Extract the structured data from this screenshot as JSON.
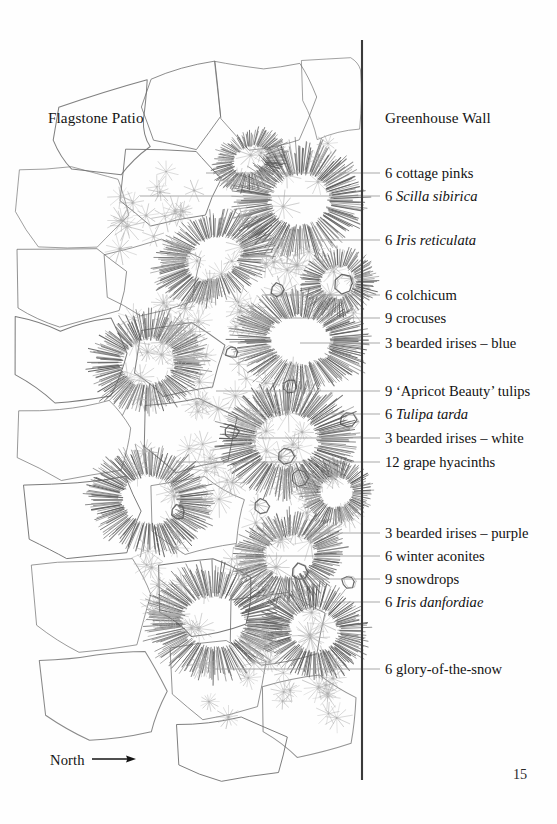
{
  "page": {
    "number": "15",
    "background": "#fefefe",
    "ink": "#141414"
  },
  "diagram": {
    "type": "garden-planting-plan",
    "orientation_label": "North",
    "orientation_icon": "arrow-right-icon",
    "patio_label": "Flagstone Patio",
    "wall_label": "Greenhouse Wall",
    "wall_color": "#3a3a3a",
    "leader_color": "#9a9a9a",
    "outline_color": "#6b6b6b",
    "hatch_color": "#5c5c5c",
    "star_color": "#aeaeae"
  },
  "plantings": [
    {
      "label_prefix": "6 ",
      "common": "cottage pinks",
      "scientific": "",
      "count": 6,
      "y": 173,
      "leader_x": 206
    },
    {
      "label_prefix": "6 ",
      "common": "",
      "scientific": "Scilla sibirica",
      "count": 6,
      "y": 196,
      "leader_x": 140
    },
    {
      "label_prefix": "6 ",
      "common": "",
      "scientific": "Iris reticulata",
      "count": 6,
      "y": 240,
      "leader_x": 256
    },
    {
      "label_prefix": "6 ",
      "common": "colchicum",
      "scientific": "",
      "count": 6,
      "y": 295,
      "leader_x": 262
    },
    {
      "label_prefix": "9 ",
      "common": "crocuses",
      "scientific": "",
      "count": 9,
      "y": 318,
      "leader_x": 240
    },
    {
      "label_prefix": "3 ",
      "common": "bearded irises – blue",
      "scientific": "",
      "count": 3,
      "y": 343,
      "leader_x": 300
    },
    {
      "label_prefix": "9 ",
      "common": "‘Apricot Beauty’ tulips",
      "scientific": "",
      "count": 9,
      "y": 391,
      "leader_x": 216
    },
    {
      "label_prefix": "6 ",
      "common": "",
      "scientific": "Tulipa tarda",
      "count": 6,
      "y": 414,
      "leader_x": 296
    },
    {
      "label_prefix": "3 ",
      "common": "bearded irises – white",
      "scientific": "",
      "count": 3,
      "y": 438,
      "leader_x": 258
    },
    {
      "label_prefix": "12 ",
      "common": "grape hyacinths",
      "scientific": "",
      "count": 12,
      "y": 462,
      "leader_x": 176
    },
    {
      "label_prefix": "3 ",
      "common": "bearded irises – purple",
      "scientific": "",
      "count": 3,
      "y": 533,
      "leader_x": 310
    },
    {
      "label_prefix": "6 ",
      "common": "winter aconites",
      "scientific": "",
      "count": 6,
      "y": 556,
      "leader_x": 236
    },
    {
      "label_prefix": "9 ",
      "common": "snowdrops",
      "scientific": "",
      "count": 9,
      "y": 579,
      "leader_x": 272
    },
    {
      "label_prefix": "6 ",
      "common": "",
      "scientific": "Iris danfordiae",
      "count": 6,
      "y": 602,
      "leader_x": 300
    },
    {
      "label_prefix": "6 ",
      "common": "glory-of-the-snow",
      "scientific": "",
      "count": 6,
      "y": 669,
      "leader_x": 214
    }
  ]
}
